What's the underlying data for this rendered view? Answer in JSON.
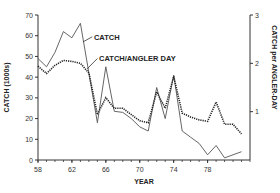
{
  "chart_data": {
    "type": "line",
    "title": "",
    "xlabel": "YEAR",
    "ylabel": "CATCH (1000s)",
    "y2label": "CATCH per ANGLER-DAY",
    "xlim": [
      58,
      83
    ],
    "ylim": [
      0,
      70
    ],
    "y2lim": [
      0,
      3
    ],
    "grid": false,
    "legend": "inline annotations",
    "x_ticks": [
      58,
      62,
      66,
      70,
      74,
      78
    ],
    "y_ticks": [
      0,
      10,
      20,
      30,
      40,
      50,
      60,
      70
    ],
    "y2_ticks": [
      1,
      2,
      3
    ],
    "x": [
      58,
      59,
      60,
      61,
      62,
      63,
      64,
      65,
      66,
      67,
      68,
      69,
      70,
      71,
      72,
      73,
      74,
      75,
      76,
      77,
      78,
      79,
      80,
      81,
      82
    ],
    "series": [
      {
        "name": "CATCH",
        "axis": "left",
        "style": "solid",
        "values": [
          49,
          45,
          52,
          62,
          59,
          66,
          42,
          18,
          45,
          23.5,
          23,
          20,
          16,
          14,
          35,
          20,
          41,
          14,
          11,
          8,
          2.5,
          7,
          1,
          2.5,
          4
        ]
      },
      {
        "name": "CATCH/ANGLER DAY",
        "axis": "right",
        "style": "dotted",
        "values": [
          1.94,
          1.79,
          1.96,
          2.06,
          2.04,
          2.0,
          1.8,
          0.94,
          1.29,
          1.07,
          1.07,
          0.94,
          0.81,
          0.77,
          1.41,
          1.07,
          1.73,
          0.97,
          0.89,
          0.83,
          0.8,
          1.2,
          0.74,
          0.74,
          0.54
        ]
      }
    ],
    "annotations": [
      {
        "text": "CATCH",
        "x": 64.6,
        "y": 59
      },
      {
        "text": "CATCH/ANGLER DAY",
        "x": 65.2,
        "y": 49
      }
    ]
  }
}
